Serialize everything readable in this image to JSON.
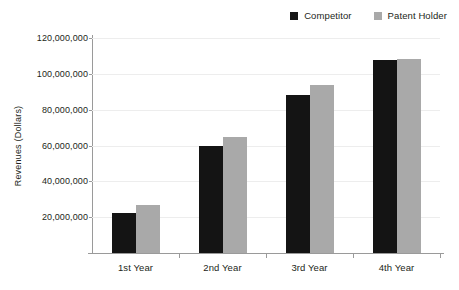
{
  "chart_data": {
    "type": "bar",
    "title": "",
    "xlabel": "",
    "ylabel": "Revenues (Dollars)",
    "categories": [
      "1st Year",
      "2nd Year",
      "3rd Year",
      "4th Year"
    ],
    "series": [
      {
        "name": "Competitor",
        "color": "#141414",
        "values": [
          22500000,
          60000000,
          88000000,
          108000000
        ]
      },
      {
        "name": "Patent Holder",
        "color": "#a9a9a9",
        "values": [
          27000000,
          65000000,
          93500000,
          108500000
        ]
      }
    ],
    "ylim": [
      0,
      120000000
    ],
    "ytick_values": [
      20000000,
      40000000,
      60000000,
      80000000,
      100000000,
      120000000
    ],
    "ytick_labels": [
      "20,000,000",
      "40,000,000",
      "60,000,000",
      "80,000,000",
      "100,000,000",
      "120,000,000"
    ],
    "grid": true,
    "legend_position": "top-right"
  },
  "legend": {
    "entries": [
      {
        "label": "Competitor",
        "swatch": "legend-swatch-competitor"
      },
      {
        "label": "Patent Holder",
        "swatch": "legend-swatch-patent-holder"
      }
    ]
  }
}
